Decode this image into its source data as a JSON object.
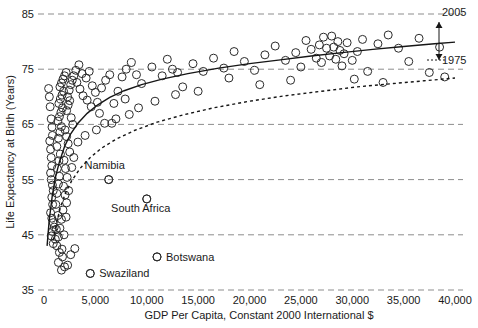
{
  "chart_data": {
    "type": "scatter",
    "title": "",
    "xlabel": "GDP Per Capita, Constant 2000 International $",
    "ylabel": "Life Expectancy at Birth (Years)",
    "xlim": [
      0,
      40000
    ],
    "ylim": [
      35,
      85
    ],
    "grid": true,
    "legend_position": "right-inline",
    "xticks": [
      0,
      5000,
      10000,
      15000,
      20000,
      25000,
      30000,
      35000,
      40000
    ],
    "xtick_labels": [
      "0",
      "5,000",
      "10,000",
      "15,000",
      "20,000",
      "25,000",
      "30,000",
      "35,000",
      "40,000"
    ],
    "yticks": [
      35,
      45,
      55,
      65,
      75,
      85
    ],
    "ytick_labels": [
      "35",
      "45",
      "55",
      "65",
      "75",
      "85"
    ],
    "series": [
      {
        "name": "2005",
        "style": "solid-curve",
        "label": "2005",
        "curve": [
          [
            300,
            43.0
          ],
          [
            500,
            47.5
          ],
          [
            800,
            52.0
          ],
          [
            1100,
            55.3
          ],
          [
            1500,
            58.2
          ],
          [
            2000,
            61.0
          ],
          [
            2600,
            63.3
          ],
          [
            3300,
            65.2
          ],
          [
            4200,
            67.0
          ],
          [
            5200,
            68.5
          ],
          [
            6400,
            69.9
          ],
          [
            7800,
            71.1
          ],
          [
            9500,
            72.2
          ],
          [
            11500,
            73.2
          ],
          [
            14000,
            74.2
          ],
          [
            17000,
            75.2
          ],
          [
            20000,
            76.0
          ],
          [
            23000,
            76.7
          ],
          [
            26000,
            77.4
          ],
          [
            29000,
            78.0
          ],
          [
            32000,
            78.6
          ],
          [
            35000,
            79.1
          ],
          [
            38000,
            79.6
          ],
          [
            40000,
            79.9
          ]
        ]
      },
      {
        "name": "1975",
        "style": "dotted-curve",
        "label": "1975",
        "curve": [
          [
            900,
            44.0
          ],
          [
            1200,
            47.0
          ],
          [
            1600,
            50.0
          ],
          [
            2100,
            52.6
          ],
          [
            2700,
            54.8
          ],
          [
            3500,
            57.0
          ],
          [
            4500,
            59.0
          ],
          [
            5600,
            60.7
          ],
          [
            7000,
            62.3
          ],
          [
            8800,
            63.9
          ],
          [
            11000,
            65.4
          ],
          [
            13500,
            66.7
          ],
          [
            16500,
            68.0
          ],
          [
            20000,
            69.2
          ],
          [
            23500,
            70.2
          ],
          [
            27000,
            71.0
          ],
          [
            30500,
            71.8
          ],
          [
            34000,
            72.4
          ],
          [
            37000,
            72.9
          ],
          [
            40000,
            73.4
          ]
        ]
      }
    ],
    "points": [
      [
        450,
        71.5
      ],
      [
        520,
        70.0
      ],
      [
        600,
        68.2
      ],
      [
        700,
        66.0
      ],
      [
        780,
        64.5
      ],
      [
        820,
        63.0
      ],
      [
        560,
        62.0
      ],
      [
        640,
        60.5
      ],
      [
        700,
        59.0
      ],
      [
        760,
        57.5
      ],
      [
        640,
        56.2
      ],
      [
        700,
        55.0
      ],
      [
        820,
        54.0
      ],
      [
        900,
        53.0
      ],
      [
        760,
        51.8
      ],
      [
        840,
        50.5
      ],
      [
        640,
        49.0
      ],
      [
        760,
        48.0
      ],
      [
        900,
        47.2
      ],
      [
        1000,
        46.4
      ],
      [
        820,
        45.6
      ],
      [
        700,
        44.8
      ],
      [
        1100,
        44.2
      ],
      [
        900,
        43.4
      ],
      [
        1200,
        46.0
      ],
      [
        1350,
        48.5
      ],
      [
        1150,
        50.5
      ],
      [
        1250,
        52.5
      ],
      [
        1400,
        54.2
      ],
      [
        1500,
        55.6
      ],
      [
        1300,
        57.0
      ],
      [
        1450,
        58.4
      ],
      [
        1600,
        59.6
      ],
      [
        1250,
        61.0
      ],
      [
        1400,
        62.5
      ],
      [
        1550,
        63.6
      ],
      [
        1700,
        64.6
      ],
      [
        1350,
        65.6
      ],
      [
        1500,
        66.4
      ],
      [
        1650,
        67.2
      ],
      [
        1800,
        68.0
      ],
      [
        1450,
        68.8
      ],
      [
        1600,
        69.6
      ],
      [
        1750,
        70.3
      ],
      [
        1900,
        71.0
      ],
      [
        1550,
        71.8
      ],
      [
        1700,
        72.5
      ],
      [
        1850,
        73.2
      ],
      [
        2000,
        73.8
      ],
      [
        2150,
        74.4
      ],
      [
        2300,
        70.0
      ],
      [
        2450,
        71.2
      ],
      [
        2600,
        72.2
      ],
      [
        2750,
        73.0
      ],
      [
        2900,
        73.8
      ],
      [
        2200,
        67.5
      ],
      [
        2350,
        68.5
      ],
      [
        2500,
        69.3
      ],
      [
        2650,
        66.2
      ],
      [
        2800,
        65.0
      ],
      [
        2050,
        64.0
      ],
      [
        2200,
        62.8
      ],
      [
        2350,
        61.5
      ],
      [
        2500,
        60.0
      ],
      [
        1950,
        58.5
      ],
      [
        2100,
        57.0
      ],
      [
        2250,
        55.4
      ],
      [
        1900,
        53.8
      ],
      [
        2050,
        52.2
      ],
      [
        2200,
        50.8
      ],
      [
        1850,
        49.5
      ],
      [
        1700,
        47.8
      ],
      [
        1550,
        46.2
      ],
      [
        1400,
        44.6
      ],
      [
        1250,
        43.0
      ],
      [
        1500,
        41.8
      ],
      [
        1800,
        41.0
      ],
      [
        1400,
        40.0
      ],
      [
        2000,
        39.2
      ],
      [
        2600,
        41.4
      ],
      [
        3000,
        42.5
      ],
      [
        2300,
        39.5
      ],
      [
        1700,
        38.6
      ],
      [
        4500,
        38.0
      ],
      [
        3100,
        74.8
      ],
      [
        3400,
        75.8
      ],
      [
        3700,
        74.2
      ],
      [
        3200,
        72.6
      ],
      [
        3500,
        71.4
      ],
      [
        3800,
        70.2
      ],
      [
        4100,
        73.4
      ],
      [
        4400,
        74.6
      ],
      [
        4700,
        72.0
      ],
      [
        5000,
        70.8
      ],
      [
        4200,
        69.4
      ],
      [
        4600,
        68.2
      ],
      [
        5200,
        69.0
      ],
      [
        5600,
        71.6
      ],
      [
        6000,
        73.0
      ],
      [
        6400,
        74.0
      ],
      [
        5400,
        67.0
      ],
      [
        5900,
        65.2
      ],
      [
        6300,
        55.0
      ],
      [
        6800,
        68.8
      ],
      [
        7200,
        71.0
      ],
      [
        7600,
        73.6
      ],
      [
        8000,
        75.0
      ],
      [
        8500,
        76.2
      ],
      [
        7000,
        66.0
      ],
      [
        7900,
        69.6
      ],
      [
        9000,
        74.0
      ],
      [
        9500,
        72.4
      ],
      [
        10000,
        51.5
      ],
      [
        10500,
        75.4
      ],
      [
        11000,
        41.0
      ],
      [
        11500,
        73.8
      ],
      [
        12000,
        76.8
      ],
      [
        12500,
        75.0
      ],
      [
        13000,
        74.4
      ],
      [
        13500,
        71.8
      ],
      [
        14500,
        76.0
      ],
      [
        15500,
        74.6
      ],
      [
        16500,
        77.0
      ],
      [
        17500,
        75.2
      ],
      [
        18500,
        78.2
      ],
      [
        19500,
        76.4
      ],
      [
        20500,
        74.8
      ],
      [
        21500,
        77.6
      ],
      [
        22500,
        79.2
      ],
      [
        23500,
        76.6
      ],
      [
        24500,
        78.0
      ],
      [
        25000,
        75.4
      ],
      [
        25500,
        80.2
      ],
      [
        26000,
        78.6
      ],
      [
        26500,
        77.0
      ],
      [
        26800,
        79.4
      ],
      [
        27000,
        76.2
      ],
      [
        27200,
        80.8
      ],
      [
        27500,
        78.8
      ],
      [
        27800,
        77.4
      ],
      [
        28000,
        81.0
      ],
      [
        28200,
        79.0
      ],
      [
        28400,
        76.8
      ],
      [
        28600,
        80.0
      ],
      [
        28800,
        78.4
      ],
      [
        29000,
        75.6
      ],
      [
        29200,
        77.8
      ],
      [
        29500,
        79.8
      ],
      [
        30000,
        76.6
      ],
      [
        30500,
        78.2
      ],
      [
        31000,
        80.4
      ],
      [
        31500,
        74.6
      ],
      [
        32500,
        79.6
      ],
      [
        33500,
        81.2
      ],
      [
        34500,
        78.8
      ],
      [
        35500,
        76.4
      ],
      [
        36500,
        80.6
      ],
      [
        37500,
        74.4
      ],
      [
        38500,
        79.0
      ],
      [
        39000,
        73.6
      ],
      [
        33000,
        72.6
      ],
      [
        30200,
        73.2
      ],
      [
        24000,
        73.0
      ],
      [
        21000,
        72.2
      ],
      [
        18000,
        73.4
      ],
      [
        15000,
        71.0
      ],
      [
        12800,
        70.4
      ],
      [
        10800,
        69.2
      ],
      [
        9200,
        68.0
      ],
      [
        8300,
        66.8
      ],
      [
        6600,
        65.2
      ],
      [
        5100,
        64.0
      ],
      [
        4000,
        63.0
      ],
      [
        3300,
        61.8
      ],
      [
        2900,
        59.0
      ],
      [
        2700,
        57.2
      ],
      [
        2400,
        53.0
      ],
      [
        2150,
        48.2
      ],
      [
        1950,
        45.0
      ],
      [
        1750,
        42.4
      ]
    ],
    "annotations": [
      {
        "name": "namibia",
        "label": "Namibia",
        "x": 6300,
        "y": 55.0,
        "label_dx": -4,
        "label_dy": -11
      },
      {
        "name": "south-africa",
        "label": "South Africa",
        "x": 10000,
        "y": 51.5,
        "label_dx": -6,
        "label_dy": 13
      },
      {
        "name": "botswana",
        "label": "Botswana",
        "x": 11000,
        "y": 41.0,
        "label_dx": 9,
        "label_dy": 4
      },
      {
        "name": "swaziland",
        "label": "Swaziland",
        "x": 4500,
        "y": 38.0,
        "label_dx": 9,
        "label_dy": 4
      }
    ],
    "series_callouts": [
      {
        "name": "label-2005",
        "label": "2005",
        "x": 442,
        "y": 16
      },
      {
        "name": "label-1975",
        "label": "1975",
        "x": 442,
        "y": 64
      }
    ],
    "colors": {
      "marker_stroke": "#2b2b2b",
      "curve": "#161616",
      "gridline": "#8d8d8d",
      "text": "#1a1a1a",
      "background": "#ffffff"
    }
  }
}
